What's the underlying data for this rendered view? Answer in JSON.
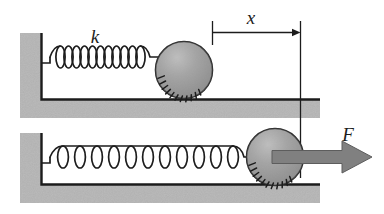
{
  "figure": {
    "type": "spring-mass-system-diagram",
    "title": "",
    "panels": [
      {
        "name": "relaxed",
        "label": "k",
        "label_meaning": "spring-constant",
        "spring_state": "relaxed",
        "spring_coils": 11,
        "ball_state": "at-rest-position"
      },
      {
        "name": "stretched",
        "label": "F",
        "label_meaning": "applied-force",
        "spring_state": "stretched",
        "spring_coils": 12,
        "ball_state": "displaced-right"
      }
    ],
    "dimension": {
      "label": "x",
      "label_meaning": "displacement",
      "arrow_direction": "right"
    },
    "colors": {
      "wall_fill": "#b5b5b5",
      "floor_fill": "#b5b5b5",
      "ball_fill": "#9a9a9a",
      "ball_highlight": "#c4c4c4",
      "force_arrow": "#808080",
      "line": "#1c1c1c",
      "background": "#ffffff"
    }
  }
}
